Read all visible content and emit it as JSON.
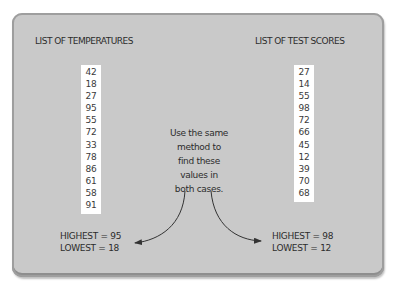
{
  "left": {
    "title": "LIST OF TEMPERATURES",
    "values": [
      "42",
      "18",
      "27",
      "95",
      "55",
      "72",
      "33",
      "78",
      "86",
      "61",
      "58",
      "91"
    ],
    "highest": "HIGHEST = 95",
    "lowest": "LOWEST = 18"
  },
  "right": {
    "title": "LIST OF TEST SCORES",
    "values": [
      "27",
      "14",
      "55",
      "98",
      "72",
      "66",
      "45",
      "12",
      "39",
      "70",
      "68"
    ],
    "highest": "HIGHEST = 98",
    "lowest": "LOWEST = 12"
  },
  "note": {
    "lines": [
      "Use the same",
      "method to",
      "find these",
      "values in",
      "both cases."
    ]
  },
  "colors": {
    "panel": "#c9c9c9",
    "panel_border": "#9e9e9e",
    "list_bg": "#ffffff",
    "text": "#2c2c2c",
    "arrow": "#333333"
  }
}
